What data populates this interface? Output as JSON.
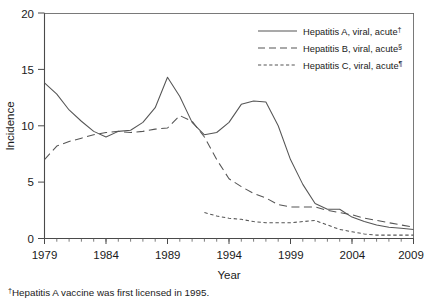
{
  "chart_data": {
    "type": "line",
    "title": "",
    "xlabel": "Year",
    "ylabel": "Incidence",
    "xlim": [
      1979,
      2009
    ],
    "ylim": [
      0,
      20
    ],
    "xticks": [
      1979,
      1984,
      1989,
      1994,
      1999,
      2004,
      2009
    ],
    "xticklabels": [
      "1979",
      "1984",
      "1989",
      "1994",
      "1999",
      "2004",
      "2009"
    ],
    "yticks": [
      0,
      5,
      10,
      15,
      20
    ],
    "yticklabels": [
      "0",
      "5",
      "10",
      "15",
      "20"
    ],
    "minor_xticks_every": 1,
    "grid": false,
    "legend_position": "top-right",
    "series": [
      {
        "name": "Hepatitis A, viral, acute",
        "footnote_marker": "†",
        "linestyle": "solid",
        "x": [
          1979,
          1980,
          1981,
          1982,
          1983,
          1984,
          1985,
          1986,
          1987,
          1988,
          1989,
          1990,
          1991,
          1992,
          1993,
          1994,
          1995,
          1996,
          1997,
          1998,
          1999,
          2000,
          2001,
          2002,
          2003,
          2004,
          2005,
          2006,
          2007,
          2008,
          2009
        ],
        "values": [
          13.8,
          12.8,
          11.4,
          10.4,
          9.5,
          9.0,
          9.5,
          9.6,
          10.3,
          11.6,
          14.3,
          12.6,
          10.3,
          9.2,
          9.4,
          10.3,
          11.9,
          12.2,
          12.1,
          10.0,
          7.0,
          4.8,
          3.1,
          2.6,
          2.6,
          1.9,
          1.5,
          1.2,
          1.0,
          0.9,
          0.8
        ],
        "units": "cases per 100,000 population"
      },
      {
        "name": "Hepatitis B, viral, acute",
        "footnote_marker": "§",
        "linestyle": "dashed-long",
        "x": [
          1979,
          1980,
          1981,
          1982,
          1983,
          1984,
          1985,
          1986,
          1987,
          1988,
          1989,
          1990,
          1991,
          1992,
          1993,
          1994,
          1995,
          1996,
          1997,
          1998,
          1999,
          2000,
          2001,
          2002,
          2003,
          2004,
          2005,
          2006,
          2007,
          2008,
          2009
        ],
        "values": [
          7.0,
          8.2,
          8.6,
          8.9,
          9.2,
          9.4,
          9.5,
          9.4,
          9.5,
          9.7,
          9.8,
          10.9,
          10.4,
          9.0,
          7.0,
          5.3,
          4.6,
          4.0,
          3.6,
          3.0,
          2.8,
          2.8,
          2.8,
          2.5,
          2.3,
          2.1,
          1.8,
          1.6,
          1.4,
          1.2,
          1.0
        ],
        "units": "cases per 100,000 population"
      },
      {
        "name": "Hepatitis C, viral, acute",
        "footnote_marker": "¶",
        "linestyle": "dashed-short",
        "x": [
          1992,
          1993,
          1994,
          1995,
          1996,
          1997,
          1998,
          1999,
          2000,
          2001,
          2002,
          2003,
          2004,
          2005,
          2006,
          2007,
          2008,
          2009
        ],
        "values": [
          2.3,
          2.0,
          1.8,
          1.7,
          1.5,
          1.4,
          1.4,
          1.4,
          1.5,
          1.6,
          1.2,
          0.8,
          0.6,
          0.4,
          0.3,
          0.3,
          0.3,
          0.3
        ],
        "units": "cases per 100,000 population"
      }
    ]
  },
  "axes": {
    "ylabel": "Incidence",
    "xlabel": "Year"
  },
  "legend": {
    "items": [
      {
        "label": "Hepatitis A, viral, acute",
        "marker": "†",
        "style": "solid"
      },
      {
        "label": "Hepatitis B, viral, acute",
        "marker": "§",
        "style": "dashed-long"
      },
      {
        "label": "Hepatitis C, viral, acute",
        "marker": "¶",
        "style": "dashed-short"
      }
    ]
  },
  "footnotes": [
    {
      "marker": "†",
      "text": "Hepatitis A vaccine was first licensed in 1995."
    }
  ]
}
